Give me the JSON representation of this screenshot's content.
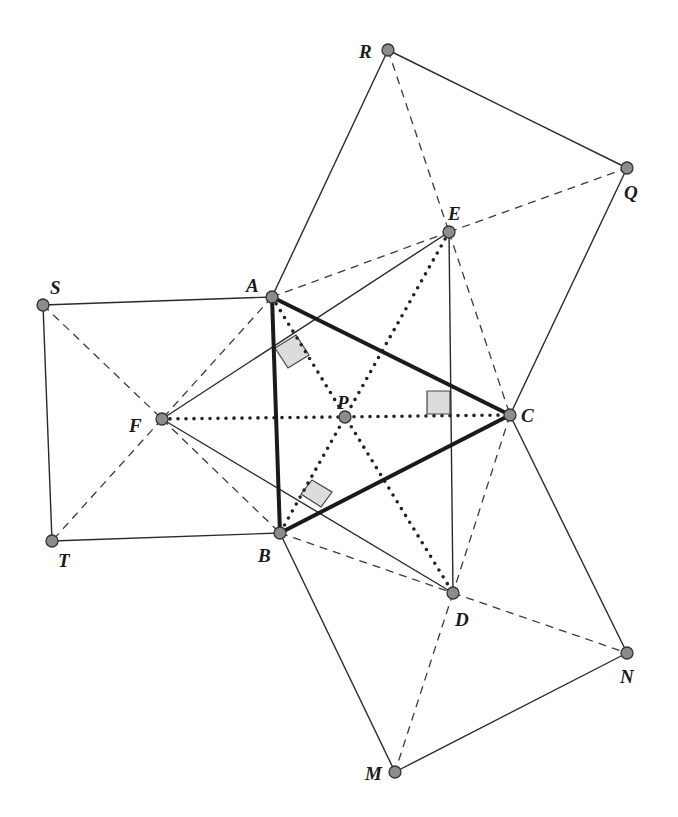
{
  "figure": {
    "points": {
      "A": {
        "x": 272,
        "y": 297,
        "label": "A",
        "lx": 246,
        "ly": 292
      },
      "B": {
        "x": 280,
        "y": 533,
        "label": "B",
        "lx": 258,
        "ly": 562
      },
      "C": {
        "x": 510,
        "y": 415,
        "label": "C",
        "lx": 521,
        "ly": 422
      },
      "D": {
        "x": 453,
        "y": 593,
        "label": "D",
        "lx": 455,
        "ly": 626
      },
      "E": {
        "x": 449,
        "y": 232,
        "label": "E",
        "lx": 448,
        "ly": 220
      },
      "F": {
        "x": 162,
        "y": 419,
        "label": "F",
        "lx": 129,
        "ly": 432
      },
      "P": {
        "x": 345,
        "y": 417,
        "label": "P",
        "lx": 337,
        "ly": 409
      },
      "Q": {
        "x": 627,
        "y": 168,
        "label": "Q",
        "lx": 624,
        "ly": 199
      },
      "R": {
        "x": 388,
        "y": 50,
        "label": "R",
        "lx": 359,
        "ly": 58
      },
      "S": {
        "x": 43,
        "y": 305,
        "label": "S",
        "lx": 50,
        "ly": 294
      },
      "T": {
        "x": 52,
        "y": 541,
        "label": "T",
        "lx": 58,
        "ly": 567
      },
      "M": {
        "x": 395,
        "y": 772,
        "label": "M",
        "lx": 365,
        "ly": 780
      },
      "N": {
        "x": 627,
        "y": 653,
        "label": "N",
        "lx": 620,
        "ly": 683
      }
    },
    "segments": {
      "solid": [
        [
          "A",
          "R"
        ],
        [
          "R",
          "Q"
        ],
        [
          "Q",
          "C"
        ],
        [
          "A",
          "S"
        ],
        [
          "S",
          "T"
        ],
        [
          "T",
          "B"
        ],
        [
          "B",
          "M"
        ],
        [
          "M",
          "N"
        ],
        [
          "N",
          "C"
        ],
        [
          "F",
          "E"
        ],
        [
          "F",
          "D"
        ],
        [
          "E",
          "D"
        ]
      ],
      "dashed": [
        [
          "R",
          "E"
        ],
        [
          "E",
          "C"
        ],
        [
          "A",
          "E"
        ],
        [
          "E",
          "Q"
        ],
        [
          "S",
          "F"
        ],
        [
          "F",
          "B"
        ],
        [
          "A",
          "F"
        ],
        [
          "F",
          "T"
        ],
        [
          "B",
          "D"
        ],
        [
          "D",
          "N"
        ],
        [
          "C",
          "D"
        ],
        [
          "D",
          "M"
        ]
      ],
      "dotted": [
        [
          "F",
          "C"
        ],
        [
          "A",
          "D"
        ],
        [
          "E",
          "B"
        ]
      ],
      "thick": [
        [
          "A",
          "B"
        ],
        [
          "B",
          "C"
        ],
        [
          "C",
          "A"
        ]
      ]
    },
    "right_angle_markers": [
      [
        [
          275,
          348
        ],
        [
          296,
          335
        ],
        [
          309,
          355
        ],
        [
          288,
          368
        ]
      ],
      [
        [
          301,
          494
        ],
        [
          312,
          480
        ],
        [
          332,
          492
        ],
        [
          321,
          507
        ]
      ],
      [
        [
          427,
          391
        ],
        [
          450,
          391
        ],
        [
          450,
          414
        ],
        [
          427,
          414
        ]
      ]
    ]
  }
}
